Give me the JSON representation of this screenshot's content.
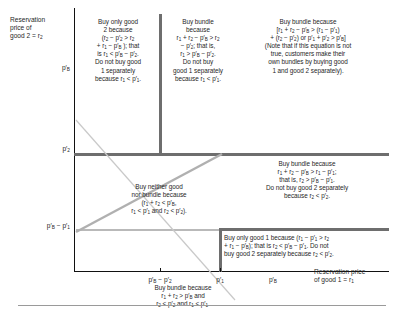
{
  "figure": {
    "axes": {
      "y_axis_title": "Reservation\nprice of\ngood 2 = r2",
      "x_axis_title": "Reservation price\nof good 1 = r1",
      "y_ticks": [
        {
          "label": "p′B",
          "name": "y-tick-pb"
        },
        {
          "label": "p′2",
          "name": "y-tick-p2"
        },
        {
          "label": "p′B − p′1",
          "name": "y-tick-pb-minus-p1"
        }
      ],
      "x_ticks": [
        {
          "label": "p′B − p′2",
          "name": "x-tick-pb-minus-p2"
        },
        {
          "label": "p′1",
          "name": "x-tick-p1"
        },
        {
          "label": "p′B",
          "name": "x-tick-pb"
        }
      ]
    },
    "regions": [
      {
        "name": "region-buy-only-good-2",
        "text": "Buy only good\n2 because\n(r2 − p′2 > r2\n+ r1 − p′B ); that\nis r1 < p′B − p′2.\nDo not buy good\n1 separately\nbecause r1 < p′1."
      },
      {
        "name": "region-buy-bundle-left",
        "text": "Buy bundle\nbecause\nr1 + r2 − p′B > r2\n− p′2; that is,\nr1 > p′B − p′2.\nDo not buy\ngood 1 separately\nbecause r1 < p′1."
      },
      {
        "name": "region-buy-bundle-top-right",
        "text": "Buy bundle because\n[r1 + r2 − p′B > (r1 − p′1)\n+ (r2 − p′2) or p′1 + p′2 > p′B]\n(Note that if this equation is not\ntrue, customers make their\nown bundles by buying good\n1 and good 2 separately)."
      },
      {
        "name": "region-buy-bundle-right",
        "text": "Buy bundle because\nr1 + r2 − p′B > r1 − p′1;\nthat is, r2 > p′B − p′1.\nDo not buy good 2 separately\nbecause r2 < p′2."
      },
      {
        "name": "region-buy-neither",
        "text": "Buy neither good\nnor bundle because\n(r1 + r2 < p′B,\nr1 < p′1 and r2 < p′2)."
      },
      {
        "name": "region-buy-only-good-1",
        "text": "Buy only good 1 because (r1 − p′1 > r2\n+ r1 − p′B); that is r2 < p′B − p′1. Do not\nbuy good 2 separately because r2 < p′2."
      },
      {
        "name": "region-buy-bundle-bottom-caption",
        "text": "Buy bundle because\nr1 + r2 > p′B and\nr2 < p′2 and r1 < p′1."
      }
    ],
    "colors": {
      "axis": "#111111",
      "partition": "#6e6e6e",
      "partition_light": "#b9b9b9",
      "text": "#1f1f1f"
    }
  }
}
